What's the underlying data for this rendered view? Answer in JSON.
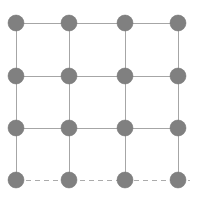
{
  "figure": {
    "type": "lattice-grid-diagram",
    "title": "",
    "width": 199,
    "height": 204,
    "background_color": "#ffffff"
  },
  "chart_data": {
    "type": "scatter",
    "title": "",
    "xlabel": "",
    "ylabel": "",
    "grid": true,
    "legend_position": "none",
    "rows": 4,
    "columns": 4,
    "node_count": 16,
    "x": [
      16,
      69,
      125,
      178
    ],
    "y": [
      23,
      76,
      128,
      180
    ],
    "node_radius": 8,
    "nodes": [
      {
        "row": 0,
        "col": 0,
        "x": 16,
        "y": 23
      },
      {
        "row": 0,
        "col": 1,
        "x": 69,
        "y": 23
      },
      {
        "row": 0,
        "col": 2,
        "x": 125,
        "y": 23
      },
      {
        "row": 0,
        "col": 3,
        "x": 178,
        "y": 23
      },
      {
        "row": 1,
        "col": 0,
        "x": 16,
        "y": 76
      },
      {
        "row": 1,
        "col": 1,
        "x": 69,
        "y": 76
      },
      {
        "row": 1,
        "col": 2,
        "x": 125,
        "y": 76
      },
      {
        "row": 1,
        "col": 3,
        "x": 178,
        "y": 76
      },
      {
        "row": 2,
        "col": 0,
        "x": 16,
        "y": 128
      },
      {
        "row": 2,
        "col": 1,
        "x": 69,
        "y": 128
      },
      {
        "row": 2,
        "col": 2,
        "x": 125,
        "y": 128
      },
      {
        "row": 2,
        "col": 3,
        "x": 178,
        "y": 128
      },
      {
        "row": 3,
        "col": 0,
        "x": 16,
        "y": 180
      },
      {
        "row": 3,
        "col": 1,
        "x": 69,
        "y": 180
      },
      {
        "row": 3,
        "col": 2,
        "x": 125,
        "y": 180
      },
      {
        "row": 3,
        "col": 3,
        "x": 178,
        "y": 180
      }
    ],
    "horizontal_edges": [
      {
        "row": 0,
        "y": 23,
        "x_start": 16,
        "x_end": 186,
        "style": "solid"
      },
      {
        "row": 1,
        "y": 76,
        "x_start": 16,
        "x_end": 186,
        "style": "solid"
      },
      {
        "row": 2,
        "y": 128,
        "x_start": 16,
        "x_end": 186,
        "style": "solid"
      },
      {
        "row": 3,
        "y": 180,
        "x_start": 8,
        "x_end": 190,
        "style": "dashed"
      }
    ],
    "vertical_edges": [
      {
        "col": 0,
        "x": 16,
        "y_start": 15,
        "y_end": 180,
        "style": "solid"
      },
      {
        "col": 1,
        "x": 69,
        "y_start": 15,
        "y_end": 180,
        "style": "solid"
      },
      {
        "col": 2,
        "x": 125,
        "y_start": 15,
        "y_end": 180,
        "style": "solid"
      },
      {
        "col": 3,
        "x": 178,
        "y_start": 15,
        "y_end": 180,
        "style": "solid"
      }
    ]
  },
  "style": {
    "node_fill": "#808080",
    "node_stroke": "#737373",
    "edge_color": "#a6a6a6",
    "dashed_edge_color": "#ababab",
    "edge_width": 1,
    "dash_pattern": "5 4"
  }
}
